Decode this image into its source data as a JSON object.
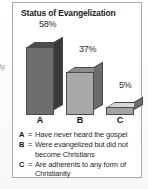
{
  "figure": {
    "title": "Status of Evangelization",
    "border_color": "#a9a9a9",
    "background": "#ffffff"
  },
  "page_bleed": {
    "fragment": "ty"
  },
  "chart_data": {
    "type": "bar",
    "title": "Status of Evangelization",
    "categories": [
      "A",
      "B",
      "C"
    ],
    "values": [
      58,
      37,
      5
    ],
    "value_labels": [
      "58%",
      "37%",
      "5%"
    ],
    "xlabel": "",
    "ylabel": "",
    "ylim": [
      0,
      65
    ],
    "grid": false,
    "legend_position": "below",
    "style": "3d-bar",
    "series_colors": [
      "#6e6e6e",
      "#a8a8a8",
      "#a3a3a3"
    ],
    "legend": [
      {
        "key": "A",
        "separator": "=",
        "description": "Have never heard the gospel"
      },
      {
        "key": "B",
        "separator": "=",
        "description": "Were evangelized but did not become Christians"
      },
      {
        "key": "C",
        "separator": "=",
        "description": "Are adherents to any form of Christianity"
      }
    ]
  }
}
